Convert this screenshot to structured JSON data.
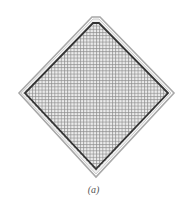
{
  "figure": {
    "caption": "(a)",
    "shape": "diamond",
    "fill_pattern": "grid-mesh",
    "colors": {
      "background": "#ffffff",
      "outer_border": "#9a9a9a",
      "inner_border": "#333333",
      "mesh": "#8c8c8c",
      "fill": "#e6e6e6"
    }
  }
}
